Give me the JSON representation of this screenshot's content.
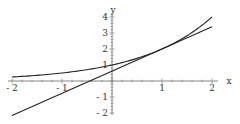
{
  "chart_data": {
    "type": "line",
    "title": "",
    "xlabel": "x",
    "ylabel": "y",
    "xlim": [
      -2,
      2
    ],
    "ylim": [
      -2,
      4
    ],
    "grid": false,
    "legend": null,
    "x_ticks": [
      "-2",
      "-1",
      "1",
      "2"
    ],
    "y_ticks": [
      "-2",
      "-1",
      "1",
      "2",
      "3",
      "4"
    ],
    "series": [
      {
        "name": "exponential curve",
        "formula": "y = 2^x",
        "x": [
          -2,
          -1.5,
          -1,
          -0.5,
          0,
          0.5,
          1,
          1.5,
          2
        ],
        "y": [
          0.25,
          0.354,
          0.5,
          0.707,
          1,
          1.414,
          2,
          2.828,
          4
        ]
      },
      {
        "name": "tangent line at x=1",
        "formula": "y = 2ln2(x-1) + 2",
        "x": [
          -2,
          2
        ],
        "y": [
          -2.16,
          3.39
        ]
      }
    ]
  }
}
